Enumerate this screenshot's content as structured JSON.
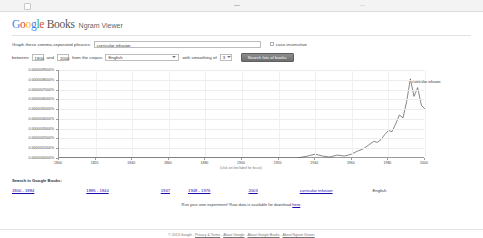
{
  "browser": {
    "tab_icon": "page-icon",
    "minimize_icon": "minimize-icon"
  },
  "header": {
    "logo_google": "Google",
    "logo_books": "Books",
    "subtitle": "Ngram Viewer"
  },
  "form": {
    "query_label": "Graph these comma-separated phrases:",
    "query_value": "curricular infusion",
    "query_placeholder": "",
    "case_insensitive_label": "case-insensitive",
    "between_label": "between",
    "year_start": "1800",
    "and_label": "and",
    "year_end": "2000",
    "corpus_label": "from the corpus",
    "corpus_value": "English",
    "smoothing_label": "with smoothing of",
    "smoothing_value": "3",
    "search_button": "Search lots of books"
  },
  "chart_data": {
    "type": "line",
    "title": "",
    "xlabel": "(click on line/label for focus)",
    "ylabel": "",
    "xlim": [
      1800,
      2000
    ],
    "ylim": [
      0,
      9e-07
    ],
    "grid": true,
    "legend_position": "inline-annotation",
    "series_name": "curricular infusion",
    "annotation": "curricular infusion",
    "y_ticks": [
      "0.0000000000%",
      "0.0000001000%",
      "0.0000002000%",
      "0.0000003000%",
      "0.0000004000%",
      "0.0000005000%",
      "0.0000006000%",
      "0.0000007000%",
      "0.0000008000%",
      "0.0000009000%"
    ],
    "x_ticks": [
      "1800",
      "1820",
      "1840",
      "1860",
      "1880",
      "1900",
      "1920",
      "1940",
      "1960",
      "1980",
      "2000"
    ],
    "x": [
      1800,
      1810,
      1820,
      1830,
      1840,
      1850,
      1860,
      1870,
      1880,
      1890,
      1900,
      1910,
      1920,
      1930,
      1936,
      1940,
      1944,
      1948,
      1952,
      1956,
      1960,
      1963,
      1966,
      1969,
      1972,
      1974,
      1976,
      1978,
      1980,
      1982,
      1984,
      1986,
      1988,
      1990,
      1992,
      1994,
      1996,
      1998,
      2000
    ],
    "values": [
      0,
      0,
      0,
      0,
      0,
      0,
      0,
      0,
      0,
      0,
      0,
      0,
      0,
      0,
      2e-08,
      4e-08,
      2e-08,
      1e-08,
      3e-08,
      2e-08,
      4e-08,
      7e-08,
      9e-08,
      1.3e-07,
      1.7e-07,
      1.6e-07,
      1.9e-07,
      2.4e-07,
      2.8e-07,
      2.7e-07,
      3.5e-07,
      4.4e-07,
      4.1e-07,
      5.8e-07,
      8.1e-07,
      6.3e-07,
      7.2e-07,
      5.4e-07,
      5e-07
    ]
  },
  "search_section": {
    "title": "Search in Google Books:",
    "links": [
      "1800 - 1884",
      "1885 - 1944",
      "1947",
      "1948 - 1976",
      "2003",
      "curricular infusion"
    ],
    "language": "English"
  },
  "run_line": {
    "text": "Run your own experiment! Raw data is available for download ",
    "link": "here",
    "suffix": "."
  },
  "footer": {
    "copyright": "© 2013 Google",
    "links": [
      "Privacy & Terms",
      "About Google",
      "About Google Books",
      "About Ngram Viewer"
    ]
  }
}
